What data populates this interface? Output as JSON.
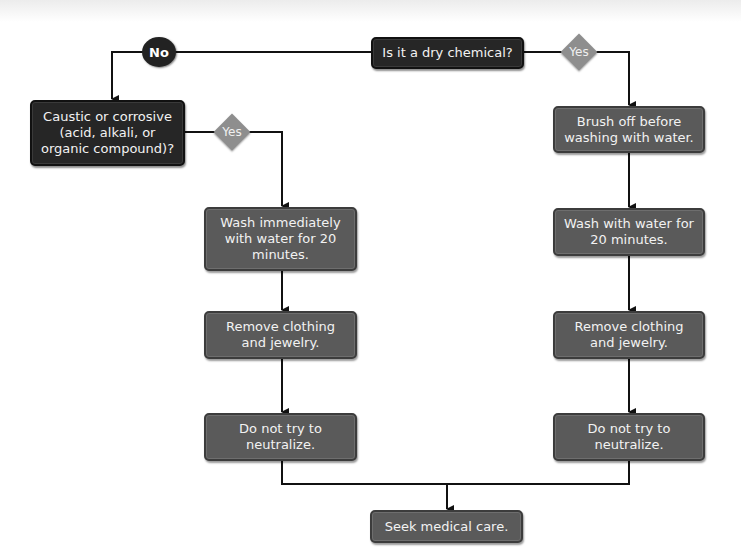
{
  "diagram": {
    "type": "flowchart",
    "decisions": {
      "dry_chemical": "Is it a dry chemical?",
      "caustic": "Caustic or corrosive (acid, alkali, or organic compound)?"
    },
    "branch_labels": {
      "no": "No",
      "yes_dry": "Yes",
      "yes_caustic": "Yes"
    },
    "left_steps": [
      "Wash immediately with water for 20 minutes.",
      "Remove clothing and jewelry.",
      "Do not try to neutralize."
    ],
    "right_steps": [
      "Brush off before washing with water.",
      "Wash with water for 20 minutes.",
      "Remove clothing and jewelry.",
      "Do not try to neutralize."
    ],
    "final_step": "Seek medical care.",
    "colors": {
      "decision_box": "#262626",
      "step_box": "#5a5a5a",
      "yes_diamond": "#8e8e8e",
      "no_circle": "#222222",
      "connector": "#111111"
    }
  }
}
